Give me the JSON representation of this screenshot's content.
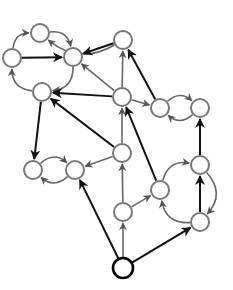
{
  "diagram": {
    "type": "directed-graph",
    "node_radius": 9,
    "colors": {
      "background": "#ffffff",
      "node_fill": "#ffffff",
      "node_stroke": "#777777",
      "root_stroke": "#000000",
      "edge_dark": "#111111",
      "edge_light": "#666666"
    },
    "nodes": [
      {
        "id": "A",
        "x": 40,
        "y": 33
      },
      {
        "id": "B",
        "x": 12,
        "y": 58
      },
      {
        "id": "C",
        "x": 73,
        "y": 57
      },
      {
        "id": "D",
        "x": 42,
        "y": 92
      },
      {
        "id": "E",
        "x": 123,
        "y": 40
      },
      {
        "id": "F",
        "x": 122,
        "y": 97
      },
      {
        "id": "G",
        "x": 160,
        "y": 108
      },
      {
        "id": "H",
        "x": 200,
        "y": 108
      },
      {
        "id": "I",
        "x": 122,
        "y": 153
      },
      {
        "id": "J",
        "x": 33,
        "y": 170
      },
      {
        "id": "K",
        "x": 75,
        "y": 170
      },
      {
        "id": "L",
        "x": 160,
        "y": 190
      },
      {
        "id": "M",
        "x": 200,
        "y": 165
      },
      {
        "id": "N",
        "x": 200,
        "y": 222
      },
      {
        "id": "O",
        "x": 123,
        "y": 212
      },
      {
        "id": "P",
        "x": 123,
        "y": 268,
        "root": true
      }
    ],
    "edges": [
      {
        "from": "B",
        "to": "A",
        "style": "light",
        "curve": "arc-up"
      },
      {
        "from": "A",
        "to": "C",
        "style": "light",
        "curve": "arc-up"
      },
      {
        "from": "B",
        "to": "C",
        "style": "dark",
        "curve": "straight"
      },
      {
        "from": "C",
        "to": "D",
        "style": "light",
        "curve": "arc-down"
      },
      {
        "from": "D",
        "to": "B",
        "style": "light",
        "curve": "arc-down"
      },
      {
        "from": "E",
        "to": "A",
        "style": "light",
        "curve": "big-arc"
      },
      {
        "from": "E",
        "to": "C",
        "style": "dark",
        "curve": "straight"
      },
      {
        "from": "F",
        "to": "C",
        "style": "light",
        "curve": "straight"
      },
      {
        "from": "F",
        "to": "D",
        "style": "dark",
        "curve": "straight"
      },
      {
        "from": "F",
        "to": "E",
        "style": "light",
        "curve": "straight"
      },
      {
        "from": "F",
        "to": "G",
        "style": "light",
        "curve": "straight"
      },
      {
        "from": "G",
        "to": "E",
        "style": "dark",
        "curve": "straight"
      },
      {
        "from": "G",
        "to": "H",
        "style": "light",
        "curve": "arc-up"
      },
      {
        "from": "H",
        "to": "G",
        "style": "light",
        "curve": "arc-down"
      },
      {
        "from": "I",
        "to": "F",
        "style": "light",
        "curve": "straight"
      },
      {
        "from": "I",
        "to": "D",
        "style": "dark",
        "curve": "straight"
      },
      {
        "from": "I",
        "to": "K",
        "style": "light",
        "curve": "straight"
      },
      {
        "from": "D",
        "to": "J",
        "style": "dark",
        "curve": "straight"
      },
      {
        "from": "J",
        "to": "K",
        "style": "light",
        "curve": "arc-up"
      },
      {
        "from": "K",
        "to": "J",
        "style": "light",
        "curve": "arc-down"
      },
      {
        "from": "L",
        "to": "F",
        "style": "dark",
        "curve": "straight"
      },
      {
        "from": "L",
        "to": "M",
        "style": "light",
        "curve": "arc-up"
      },
      {
        "from": "N",
        "to": "L",
        "style": "light",
        "curve": "arc-down"
      },
      {
        "from": "M",
        "to": "N",
        "style": "light",
        "curve": "arc-right"
      },
      {
        "from": "N",
        "to": "M",
        "style": "dark",
        "curve": "straight"
      },
      {
        "from": "M",
        "to": "H",
        "style": "dark",
        "curve": "straight"
      },
      {
        "from": "O",
        "to": "I",
        "style": "light",
        "curve": "straight"
      },
      {
        "from": "O",
        "to": "L",
        "style": "light",
        "curve": "straight"
      },
      {
        "from": "P",
        "to": "O",
        "style": "light",
        "curve": "straight"
      },
      {
        "from": "P",
        "to": "K",
        "style": "dark",
        "curve": "straight"
      },
      {
        "from": "P",
        "to": "N",
        "style": "dark",
        "curve": "straight"
      }
    ]
  }
}
